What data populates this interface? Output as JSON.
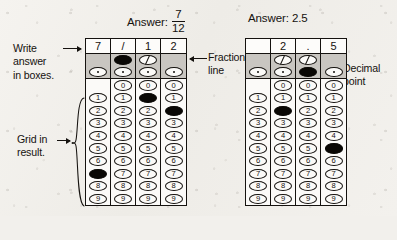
{
  "headings": {
    "fraction": {
      "prefix": "Answer:",
      "numerator": "7",
      "denominator": "12"
    },
    "decimal": {
      "text": "Answer: 2.5"
    }
  },
  "annotations": {
    "write_answer": {
      "line1": "Write",
      "line2": "answer",
      "line3": "in boxes."
    },
    "grid_in_result": {
      "line1": "Grid in",
      "line2": "result."
    },
    "fraction_line": {
      "line1": "Fraction",
      "line2": "line"
    },
    "decimal_point": {
      "line1": "Decimal",
      "line2": "point"
    }
  },
  "bubble_rows": [
    "0",
    "1",
    "2",
    "3",
    "4",
    "5",
    "6",
    "7",
    "8",
    "9"
  ],
  "glyphs": {
    "slash": "/",
    "dot": ".",
    "blank": ""
  },
  "grids": {
    "fraction_grid": {
      "label": "fraction-answer-grid",
      "columns": [
        {
          "written": "7",
          "has_slash_bubble": false,
          "has_dot_bubble": true,
          "has_zero_bubble": false,
          "slash_filled": false,
          "dot_filled": false,
          "filled_digit": "7"
        },
        {
          "written": "/",
          "has_slash_bubble": true,
          "has_dot_bubble": true,
          "has_zero_bubble": true,
          "slash_filled": true,
          "dot_filled": false,
          "filled_digit": null
        },
        {
          "written": "1",
          "has_slash_bubble": true,
          "has_dot_bubble": true,
          "has_zero_bubble": true,
          "slash_filled": false,
          "dot_filled": false,
          "filled_digit": "1"
        },
        {
          "written": "2",
          "has_slash_bubble": false,
          "has_dot_bubble": true,
          "has_zero_bubble": true,
          "slash_filled": false,
          "dot_filled": false,
          "filled_digit": "2"
        }
      ]
    },
    "decimal_grid": {
      "label": "decimal-answer-grid",
      "columns": [
        {
          "written": "",
          "has_slash_bubble": false,
          "has_dot_bubble": true,
          "has_zero_bubble": false,
          "slash_filled": false,
          "dot_filled": false,
          "filled_digit": null
        },
        {
          "written": "2",
          "has_slash_bubble": true,
          "has_dot_bubble": true,
          "has_zero_bubble": true,
          "slash_filled": false,
          "dot_filled": false,
          "filled_digit": "2"
        },
        {
          "written": ".",
          "has_slash_bubble": true,
          "has_dot_bubble": true,
          "has_zero_bubble": true,
          "slash_filled": false,
          "dot_filled": true,
          "filled_digit": null
        },
        {
          "written": "5",
          "has_slash_bubble": false,
          "has_dot_bubble": true,
          "has_zero_bubble": true,
          "slash_filled": false,
          "dot_filled": false,
          "filled_digit": "5"
        }
      ]
    }
  },
  "colors": {
    "ink": "#15120f",
    "paper": "#f2f0ec",
    "grid_fill": "#fbfaf8",
    "shade": "#c9c6c1",
    "filled_bubble": "#0a0805"
  }
}
